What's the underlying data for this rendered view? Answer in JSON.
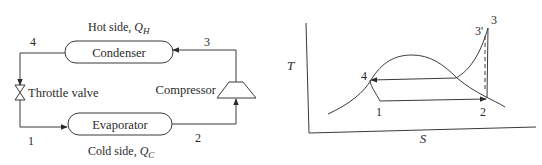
{
  "cycle_diagram": {
    "hot_side_label": "Hot side, ",
    "hot_side_symbol": "Q",
    "hot_side_subscript": "H",
    "cold_side_label": "Cold side, ",
    "cold_side_symbol": "Q",
    "cold_side_subscript": "C",
    "condenser_label": "Condenser",
    "evaporator_label": "Evaporator",
    "throttle_label": "Throttle valve",
    "compressor_label": "Compressor",
    "points": {
      "p1": "1",
      "p2": "2",
      "p3": "3",
      "p4": "4"
    }
  },
  "ts_diagram": {
    "y_axis_label": "T",
    "x_axis_label": "S",
    "points": {
      "p1": "1",
      "p2": "2",
      "p3": "3",
      "p3prime": "3'",
      "p4": "4"
    }
  },
  "colors": {
    "line": "#3a3a3a",
    "text": "#2a2a2a",
    "background": "#ffffff"
  }
}
